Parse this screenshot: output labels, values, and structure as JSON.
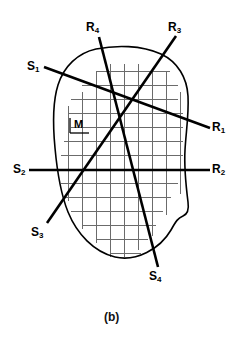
{
  "figure": {
    "caption": "(b)",
    "region_label": "M",
    "colors": {
      "ink": "#000000",
      "grid": "#6b6b6b",
      "outline": "#000000",
      "background": "#ffffff"
    },
    "ray_labels": [
      {
        "name": "R1",
        "base": "R",
        "sub": "1",
        "x": 212,
        "y": 121
      },
      {
        "name": "R2",
        "base": "R",
        "sub": "2",
        "x": 212,
        "y": 163
      },
      {
        "name": "R3",
        "base": "R",
        "sub": "3",
        "x": 168,
        "y": 21
      },
      {
        "name": "R4",
        "base": "R",
        "sub": "4",
        "x": 86,
        "y": 21
      }
    ],
    "source_labels": [
      {
        "name": "S1",
        "base": "S",
        "sub": "1",
        "x": 27,
        "y": 60
      },
      {
        "name": "S2",
        "base": "S",
        "sub": "2",
        "x": 13,
        "y": 163
      },
      {
        "name": "S3",
        "base": "S",
        "sub": "3",
        "x": 31,
        "y": 226
      },
      {
        "name": "S4",
        "base": "S",
        "sub": "4",
        "x": 149,
        "y": 270
      }
    ],
    "projection_lines": [
      {
        "name": "S1-R1",
        "from": "S1",
        "to": "R1",
        "x1": 44,
        "y1": 67,
        "x2": 210,
        "y2": 128
      },
      {
        "name": "S2-R2",
        "from": "S2",
        "to": "R2",
        "x1": 29,
        "y1": 170,
        "x2": 210,
        "y2": 170
      },
      {
        "name": "S3-R3",
        "from": "S3",
        "to": "R3",
        "x1": 47,
        "y1": 223,
        "x2": 176,
        "y2": 36
      },
      {
        "name": "R4-S4",
        "from": "R4",
        "to": "S4",
        "x1": 99,
        "y1": 37,
        "x2": 158,
        "y2": 267
      }
    ],
    "grid": {
      "description": "pixel grid overlaying object region M",
      "spacing": 14,
      "rows": [
        {
          "y": 71,
          "x1": 97,
          "x2": 170
        },
        {
          "y": 85,
          "x1": 82,
          "x2": 178
        },
        {
          "y": 99,
          "x1": 71,
          "x2": 178
        },
        {
          "y": 113,
          "x1": 68,
          "x2": 183
        },
        {
          "y": 127,
          "x1": 71,
          "x2": 183
        },
        {
          "y": 141,
          "x1": 64,
          "x2": 183
        },
        {
          "y": 155,
          "x1": 61,
          "x2": 183
        },
        {
          "y": 169,
          "x1": 61,
          "x2": 181
        },
        {
          "y": 183,
          "x1": 61,
          "x2": 178
        },
        {
          "y": 197,
          "x1": 64,
          "x2": 171
        },
        {
          "y": 211,
          "x1": 71,
          "x2": 163
        },
        {
          "y": 225,
          "x1": 82,
          "x2": 156
        },
        {
          "y": 239,
          "x1": 97,
          "x2": 148
        },
        {
          "y": 253,
          "x1": 111,
          "x2": 141
        }
      ],
      "cols": [
        {
          "x": 68,
          "y1": 106,
          "y2": 201
        },
        {
          "x": 82,
          "y1": 92,
          "y2": 229
        },
        {
          "x": 96,
          "y1": 71,
          "y2": 243
        },
        {
          "x": 110,
          "y1": 64,
          "y2": 257
        },
        {
          "x": 124,
          "y1": 64,
          "y2": 257
        },
        {
          "x": 138,
          "y1": 64,
          "y2": 250
        },
        {
          "x": 152,
          "y1": 68,
          "y2": 236
        },
        {
          "x": 166,
          "y1": 71,
          "y2": 215
        },
        {
          "x": 180,
          "y1": 92,
          "y2": 194
        }
      ]
    },
    "outline": {
      "name": "object-boundary",
      "path": "M 96 49 C 78 53 64 66 58 85 C 52 104 53 127 55 148 C 57 170 60 192 68 212 C 77 234 94 252 115 257 C 136 262 160 249 171 230 C 176 221 178 218 183 216 C 188 214 189 209 188 202 C 186 186 184 168 185 150 C 186 132 189 114 188 96 C 187 78 178 62 161 54 C 141 45 116 45 96 49 Z"
    }
  }
}
